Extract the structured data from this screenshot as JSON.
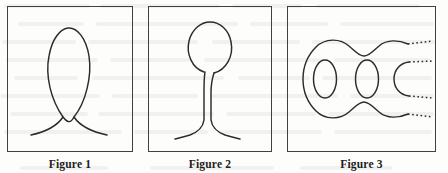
{
  "page": {
    "width": 448,
    "height": 173,
    "background_color": "#fdfdfc",
    "ink_color": "#2b2b29",
    "frame_color": "#40403e"
  },
  "figures": [
    {
      "id": "figure-1",
      "caption": "Figure 1",
      "frame": {
        "x": 7,
        "y": 6,
        "width": 126,
        "height": 146
      },
      "caption_box": {
        "x": 7,
        "y": 153,
        "width": 126
      },
      "art_name": "single-loop-with-crossed-tails",
      "art_description": "A tall narrow vertical loop whose two strands cross below the loop and flare outward into two tails."
    },
    {
      "id": "figure-2",
      "caption": "Figure 2",
      "frame": {
        "x": 148,
        "y": 6,
        "width": 124,
        "height": 146
      },
      "caption_box": {
        "x": 148,
        "y": 153,
        "width": 124
      },
      "art_name": "balloon-loop-with-split-stem",
      "art_description": "An egg shaped loop at top with a narrow double stem descending and splaying outward at the bottom."
    },
    {
      "id": "figure-3",
      "caption": "Figure 3",
      "frame": {
        "x": 287,
        "y": 6,
        "width": 149,
        "height": 146
      },
      "caption_box": {
        "x": 287,
        "y": 153,
        "width": 149
      },
      "art_name": "repeating-loop-chain-with-dotted-continuation",
      "art_description": "A horizontal chain of two complete nested O loops plus a third partial C loop, with four dotted trails continuing to the right edge.",
      "dotted_trail_count": 4,
      "complete_loops": 2,
      "partial_loops": 1
    }
  ],
  "ghost_text": {
    "visible": true,
    "legible": false,
    "note": "Faint bleed-through of text from the reverse side of the scanned page; not readable."
  }
}
